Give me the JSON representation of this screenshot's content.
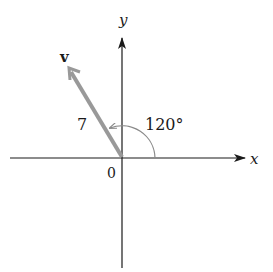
{
  "diagram": {
    "axes": {
      "x_label": "x",
      "y_label": "y",
      "origin_label": "0"
    },
    "vector": {
      "name": "v",
      "magnitude_label": "7",
      "angle_label": "120°",
      "magnitude": 7,
      "angle_deg": 120
    },
    "colors": {
      "axis": "#1a1a1a",
      "vector": "#999999",
      "arc": "#8a8a8a"
    }
  }
}
